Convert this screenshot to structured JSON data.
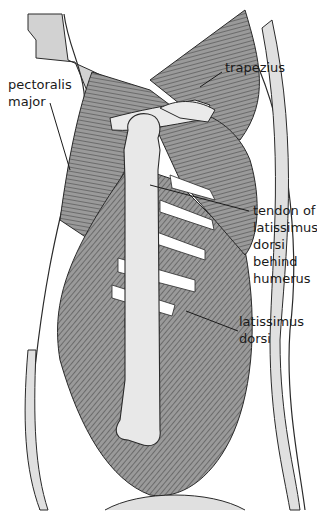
{
  "figure": {
    "colors": {
      "background": "#ffffff",
      "muscle_fill": "#8c8c8c",
      "muscle_line": "#3a3a3a",
      "bone_fill": "#e6e6e6",
      "skin_fill": "#cfcfcf",
      "outline": "#2a2a2a",
      "label_text": "#1a1a1a"
    }
  },
  "labels": [
    {
      "id": "pectoralis-major",
      "text": "pectoralis\nmajor"
    },
    {
      "id": "trapezius",
      "text": "trapezius"
    },
    {
      "id": "tendon-latissimus",
      "text": "tendon of\nlatissimus\ndorsi\nbehind\nhumerus"
    },
    {
      "id": "latissimus-dorsi",
      "text": "latissimus\ndorsi"
    }
  ]
}
